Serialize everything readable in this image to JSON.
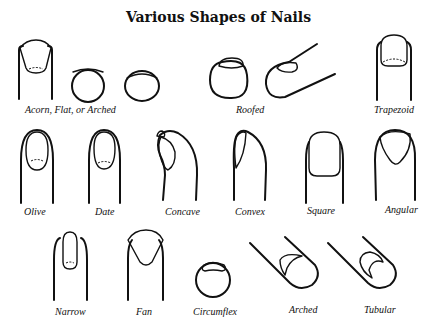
{
  "title": "Various Shapes of Nails",
  "shapes": [
    {
      "name": "acorn-flat-arched",
      "label": "Acorn, Flat, or Arched"
    },
    {
      "name": "roofed",
      "label": "Roofed"
    },
    {
      "name": "trapezoid",
      "label": "Trapezoid"
    },
    {
      "name": "olive",
      "label": "Olive"
    },
    {
      "name": "date",
      "label": "Date"
    },
    {
      "name": "concave",
      "label": "Concave"
    },
    {
      "name": "convex",
      "label": "Convex"
    },
    {
      "name": "square",
      "label": "Square"
    },
    {
      "name": "angular",
      "label": "Angular"
    },
    {
      "name": "narrow",
      "label": "Narrow"
    },
    {
      "name": "fan",
      "label": "Fan"
    },
    {
      "name": "circumflex",
      "label": "Circumflex"
    },
    {
      "name": "arched",
      "label": "Arched"
    },
    {
      "name": "tubular",
      "label": "Tubular"
    }
  ]
}
